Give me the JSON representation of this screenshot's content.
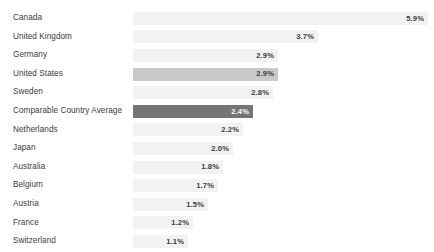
{
  "chart_data": {
    "type": "bar",
    "orientation": "horizontal",
    "title": "",
    "subtitle": "",
    "xlabel": "",
    "ylabel": "",
    "grid": false,
    "legend": "none",
    "axis_visible": false,
    "value_suffix": "%",
    "xlim": [
      0,
      5.9
    ],
    "categories": [
      "Canada",
      "United Kingdom",
      "Germany",
      "United States",
      "Sweden",
      "Comparable Country Average",
      "Netherlands",
      "Japan",
      "Australia",
      "Belgium",
      "Austria",
      "France",
      "Switzerland"
    ],
    "values": [
      5.9,
      3.7,
      2.9,
      2.9,
      2.8,
      2.4,
      2.2,
      2.0,
      1.8,
      1.7,
      1.5,
      1.2,
      1.1
    ],
    "value_labels": [
      "5.9%",
      "3.7%",
      "2.9%",
      "2.9%",
      "2.8%",
      "2.4%",
      "2.2%",
      "2.0%",
      "1.8%",
      "1.7%",
      "1.5%",
      "1.2%",
      "1.1%"
    ],
    "bar_styles": [
      "normal",
      "normal",
      "normal",
      "highlight-mid",
      "normal",
      "highlight-dark",
      "normal",
      "normal",
      "normal",
      "normal",
      "normal",
      "normal",
      "normal"
    ],
    "colors": {
      "background": "#ffffff",
      "bar_default": "#f2f2f2",
      "bar_highlight_mid": "#c9c9c9",
      "bar_highlight_dark": "#757575",
      "label_text": "#3c3c3c",
      "value_text_dark": "#3c3c3c",
      "value_text_light": "#ffffff"
    }
  }
}
